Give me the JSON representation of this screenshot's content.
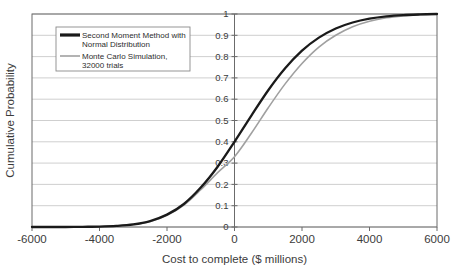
{
  "chart_data": {
    "type": "line",
    "title": "",
    "xlabel": "Cost to complete ($ millions)",
    "ylabel": "Cumulative Probability",
    "xlim": [
      -6000,
      6000
    ],
    "ylim": [
      0,
      1
    ],
    "xticks": [
      "-6000",
      "-4000",
      "-2000",
      "0",
      "2000",
      "4000",
      "6000"
    ],
    "xtick_values": [
      -6000,
      -4000,
      -2000,
      0,
      2000,
      4000,
      6000
    ],
    "yticks": [
      "0",
      "0.1",
      "0.2",
      "0.3",
      "0.4",
      "0.5",
      "0.6",
      "0.7",
      "0.8",
      "0.9",
      "1"
    ],
    "ytick_values": [
      0,
      0.1,
      0.2,
      0.3,
      0.4,
      0.5,
      0.6,
      0.7,
      0.8,
      0.9,
      1
    ],
    "grid": "horizontal",
    "legend_position": "upper-left",
    "x": [
      -6000,
      -5500,
      -5000,
      -4500,
      -4000,
      -3500,
      -3000,
      -2500,
      -2000,
      -1500,
      -1000,
      -500,
      0,
      500,
      1000,
      1500,
      2000,
      2500,
      3000,
      3500,
      4000,
      4500,
      5000,
      5500,
      6000
    ],
    "series": [
      {
        "name": "Second Moment Method with Normal Distribution",
        "color": "#1a1a1a",
        "width": 2.3,
        "values": [
          0.0,
          0.0,
          0.0,
          0.001,
          0.002,
          0.005,
          0.012,
          0.028,
          0.058,
          0.108,
          0.185,
          0.283,
          0.4,
          0.523,
          0.642,
          0.745,
          0.828,
          0.889,
          0.932,
          0.96,
          0.978,
          0.989,
          0.995,
          0.998,
          1.0
        ]
      },
      {
        "name": "Monte Carlo Simulation, 32000 trials",
        "color": "#a0a0a0",
        "width": 1.6,
        "values": [
          0.0,
          0.0,
          0.0,
          0.0,
          0.001,
          0.004,
          0.011,
          0.026,
          0.055,
          0.103,
          0.175,
          0.255,
          0.33,
          0.44,
          0.56,
          0.672,
          0.768,
          0.845,
          0.9,
          0.94,
          0.966,
          0.982,
          0.991,
          0.996,
          1.0
        ]
      }
    ],
    "legend": [
      {
        "line1": "Second Moment Method with",
        "line2": "Normal Distribution",
        "color": "#1a1a1a",
        "width": 3.2
      },
      {
        "line1": "Monte Carlo Simulation,",
        "line2": "32000 trials",
        "color": "#a0a0a0",
        "width": 1.6
      }
    ],
    "colors": {
      "grid": "#c9c9c9",
      "axis": "#6b6b6b",
      "text": "#3b3b3b",
      "background": "#ffffff"
    }
  }
}
